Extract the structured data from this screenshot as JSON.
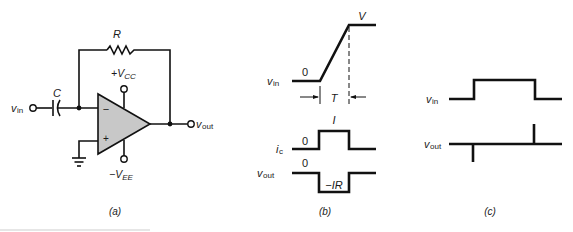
{
  "panel_a": {
    "caption": "(a)",
    "labels": {
      "R": "R",
      "C": "C",
      "vin_main": "v",
      "vin_sub": "in",
      "vout_main": "v",
      "vout_sub": "out",
      "vcc_main": "+V",
      "vcc_sub": "CC",
      "vee_main": "−V",
      "vee_sub": "EE",
      "minus": "−",
      "plus": "+"
    },
    "opamp_fill": "#c8c8c8"
  },
  "panel_b": {
    "caption": "(b)",
    "labels": {
      "V": "V",
      "zero_vin": "0",
      "vin_main": "v",
      "vin_sub": "in",
      "T": "T",
      "I": "I",
      "zero_ic": "0",
      "ic_main": "i",
      "ic_sub": "c",
      "zero_vout": "0",
      "vout_main": "v",
      "vout_sub": "out",
      "minus_IR": "−IR"
    }
  },
  "panel_c": {
    "caption": "(c)",
    "labels": {
      "vin_main": "v",
      "vin_sub": "in",
      "vout_main": "v",
      "vout_sub": "out"
    }
  }
}
